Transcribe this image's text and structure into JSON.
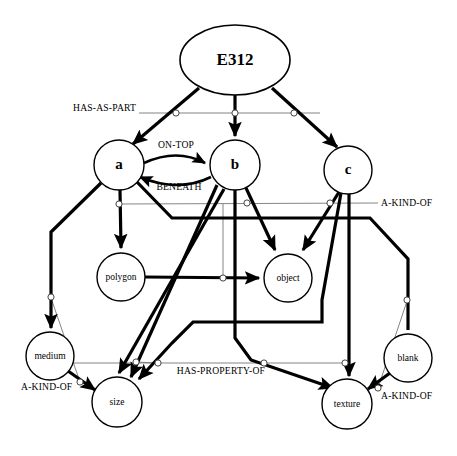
{
  "diagram": {
    "type": "semantic-network",
    "background_color": "#ffffff",
    "line_color": "#000000",
    "thin_line_color": "#777777",
    "width": 457,
    "height": 456
  },
  "nodes": [
    {
      "id": "e312",
      "label": "E312",
      "shape": "ellipse",
      "cx": 235,
      "cy": 60,
      "rx": 55,
      "ry": 35,
      "style": "root"
    },
    {
      "id": "a",
      "label": "a",
      "shape": "circle",
      "cx": 119,
      "cy": 165,
      "r": 25,
      "style": "var"
    },
    {
      "id": "b",
      "label": "b",
      "shape": "circle",
      "cx": 235,
      "cy": 165,
      "r": 25,
      "style": "var"
    },
    {
      "id": "c",
      "label": "c",
      "shape": "circle",
      "cx": 348,
      "cy": 170,
      "r": 24,
      "style": "var"
    },
    {
      "id": "polygon",
      "label": "polygon",
      "shape": "circle",
      "cx": 121,
      "cy": 277,
      "r": 24,
      "style": "concept"
    },
    {
      "id": "object",
      "label": "object",
      "shape": "circle",
      "cx": 288,
      "cy": 278,
      "r": 24,
      "style": "concept"
    },
    {
      "id": "medium",
      "label": "medium",
      "shape": "circle",
      "cx": 50,
      "cy": 356,
      "r": 24,
      "style": "concept"
    },
    {
      "id": "blank",
      "label": "blank",
      "shape": "circle",
      "cx": 408,
      "cy": 358,
      "r": 24,
      "style": "concept"
    },
    {
      "id": "size",
      "label": "size",
      "shape": "circle",
      "cx": 117,
      "cy": 402,
      "r": 25,
      "style": "concept"
    },
    {
      "id": "texture",
      "label": "texture",
      "shape": "circle",
      "cx": 347,
      "cy": 404,
      "r": 25,
      "style": "concept"
    }
  ],
  "relation_labels": [
    {
      "id": "has-as-part",
      "text": "HAS-AS-PART",
      "x": 73,
      "y": 111,
      "anchor": "start"
    },
    {
      "id": "on-top",
      "text": "ON-TOP",
      "x": 176,
      "y": 148,
      "anchor": "middle"
    },
    {
      "id": "beneath",
      "text": "BENEATH",
      "x": 179,
      "y": 190,
      "anchor": "middle"
    },
    {
      "id": "a-kind-of-right",
      "text": "A-KIND-OF",
      "x": 381,
      "y": 206,
      "anchor": "start"
    },
    {
      "id": "has-property-of",
      "text": "HAS-PROPERTY-OF",
      "x": 221,
      "y": 374,
      "anchor": "middle"
    },
    {
      "id": "a-kind-of-left",
      "text": "A-KIND-OF",
      "x": 21,
      "y": 390,
      "anchor": "start"
    },
    {
      "id": "a-kind-of-bottom",
      "text": "A-KIND-OF",
      "x": 381,
      "y": 399,
      "anchor": "start"
    }
  ],
  "edges": [
    {
      "id": "e312-a",
      "from": "e312",
      "to": "a",
      "relation": "HAS-AS-PART",
      "weight": "thick",
      "arrow": true
    },
    {
      "id": "e312-b",
      "from": "e312",
      "to": "b",
      "relation": "HAS-AS-PART",
      "weight": "thick",
      "arrow": true
    },
    {
      "id": "e312-c",
      "from": "e312",
      "to": "c",
      "relation": "HAS-AS-PART",
      "weight": "thick",
      "arrow": true
    },
    {
      "id": "a-b-on-top",
      "from": "a",
      "to": "b",
      "relation": "ON-TOP",
      "weight": "curve",
      "arrow": true
    },
    {
      "id": "b-a-beneath",
      "from": "b",
      "to": "a",
      "relation": "BENEATH",
      "weight": "curve",
      "arrow": true
    },
    {
      "id": "a-polygon",
      "from": "a",
      "to": "polygon",
      "relation": "A-KIND-OF",
      "weight": "thick",
      "arrow": true
    },
    {
      "id": "a-medium",
      "from": "a",
      "to": "medium",
      "relation": "HAS-PROPERTY-OF",
      "weight": "thick",
      "arrow": true
    },
    {
      "id": "a-size",
      "from": "a",
      "to": "size",
      "relation": "HAS-PROPERTY-OF",
      "weight": "thick",
      "arrow": true
    },
    {
      "id": "b-object",
      "from": "b",
      "to": "object",
      "relation": "A-KIND-OF",
      "weight": "thick",
      "arrow": true
    },
    {
      "id": "b-size",
      "from": "b",
      "to": "size",
      "relation": "HAS-PROPERTY-OF",
      "weight": "thick",
      "arrow": true
    },
    {
      "id": "b-texture",
      "from": "b",
      "to": "texture",
      "relation": "HAS-PROPERTY-OF",
      "weight": "thick",
      "arrow": true
    },
    {
      "id": "c-object",
      "from": "c",
      "to": "object",
      "relation": "A-KIND-OF",
      "weight": "thick",
      "arrow": true
    },
    {
      "id": "c-blank",
      "from": "c",
      "to": "blank",
      "relation": "HAS-PROPERTY-OF",
      "weight": "thick",
      "arrow": true
    },
    {
      "id": "c-size",
      "from": "c",
      "to": "size",
      "relation": "HAS-PROPERTY-OF",
      "weight": "thick",
      "arrow": true
    },
    {
      "id": "c-texture",
      "from": "c",
      "to": "texture",
      "relation": "HAS-PROPERTY-OF",
      "weight": "thick",
      "arrow": true
    },
    {
      "id": "polygon-object",
      "from": "polygon",
      "to": "object",
      "relation": "A-KIND-OF",
      "weight": "thick",
      "arrow": true
    },
    {
      "id": "medium-size",
      "from": "medium",
      "to": "size",
      "relation": "A-KIND-OF",
      "weight": "thick",
      "arrow": true
    },
    {
      "id": "blank-texture",
      "from": "blank",
      "to": "texture",
      "relation": "A-KIND-OF",
      "weight": "thick",
      "arrow": true
    }
  ],
  "link_markers": [
    {
      "id": "lm-hasaspart-a",
      "cx": 176,
      "cy": 113
    },
    {
      "id": "lm-hasaspart-b",
      "cx": 235,
      "cy": 113
    },
    {
      "id": "lm-hasaspart-c",
      "cx": 294,
      "cy": 113
    },
    {
      "id": "lm-akind-a",
      "cx": 119,
      "cy": 204
    },
    {
      "id": "lm-akind-b",
      "cx": 247,
      "cy": 203
    },
    {
      "id": "lm-akind-c",
      "cx": 330,
      "cy": 203
    },
    {
      "id": "lm-akind-poly",
      "cx": 223,
      "cy": 278
    },
    {
      "id": "lm-prop-medium",
      "cx": 51,
      "cy": 297
    },
    {
      "id": "lm-prop-blank",
      "cx": 407,
      "cy": 300
    },
    {
      "id": "lm-prop-a",
      "cx": 51,
      "cy": 363
    },
    {
      "id": "lm-prop-size1",
      "cx": 136,
      "cy": 362
    },
    {
      "id": "lm-prop-size2",
      "cx": 158,
      "cy": 363
    },
    {
      "id": "lm-prop-tex1",
      "cx": 264,
      "cy": 363
    },
    {
      "id": "lm-prop-tex2",
      "cx": 345,
      "cy": 363
    },
    {
      "id": "lm-akind-med",
      "cx": 80,
      "cy": 382
    },
    {
      "id": "lm-akind-blank",
      "cx": 378,
      "cy": 388
    }
  ]
}
